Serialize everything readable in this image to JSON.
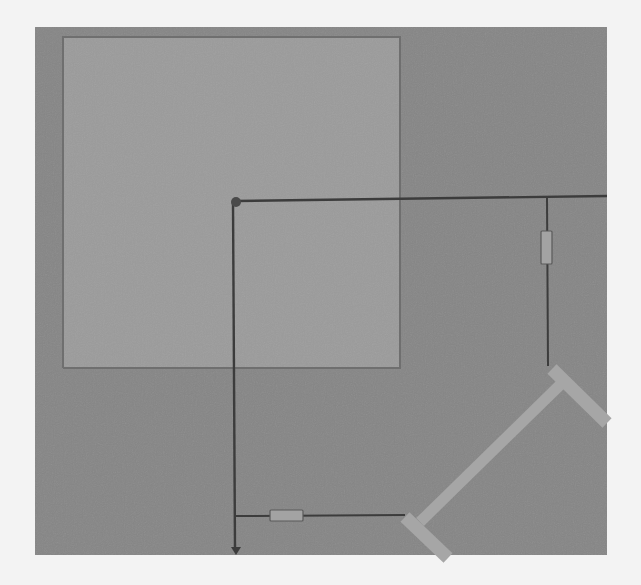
{
  "scene": {
    "view": "top-down",
    "colors": {
      "page_background": "#f3f3f3",
      "canvas": "#868686",
      "room": "#9b9b9b",
      "line": "#3c3c3c",
      "component_fill": "#a3a3a3",
      "wall_bar": "#a6a6a6",
      "node": "#4a4a4a"
    },
    "canvas": {
      "x": 35,
      "y": 27,
      "width": 572,
      "height": 528
    },
    "room": {
      "x": 63,
      "y": 37,
      "width": 337,
      "height": 331,
      "label": "room-area"
    },
    "node": {
      "x": 236,
      "y": 202,
      "r": 5
    },
    "lines": [
      {
        "id": "top-horizontal",
        "x1": 236,
        "y1": 201,
        "x2": 607,
        "y2": 196
      },
      {
        "id": "left-vertical",
        "x1": 233,
        "y1": 202,
        "x2": 235,
        "y2": 549
      },
      {
        "id": "right-vertical",
        "x1": 547,
        "y1": 197,
        "x2": 548,
        "y2": 366
      },
      {
        "id": "bottom-horizontal",
        "x1": 235,
        "y1": 516,
        "x2": 405,
        "y2": 515
      }
    ],
    "components": [
      {
        "id": "vertical-component",
        "x": 541,
        "y": 231,
        "width": 11,
        "height": 33
      },
      {
        "id": "horizontal-component",
        "x": 270,
        "y": 510,
        "width": 33,
        "height": 11
      }
    ],
    "arrow": {
      "x": 236,
      "y": 549,
      "direction": "down"
    },
    "walls": {
      "diagonal": {
        "x1": 420,
        "y1": 522,
        "x2": 560,
        "y2": 385,
        "width": 11
      },
      "top_cap": {
        "x1": 552,
        "y1": 369,
        "x2": 607,
        "y2": 423,
        "width": 13
      },
      "bottom_cap": {
        "x1": 405,
        "y1": 517,
        "x2": 448,
        "y2": 558,
        "width": 13
      }
    }
  }
}
